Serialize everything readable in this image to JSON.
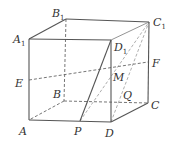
{
  "figure": {
    "vertices": {
      "A": {
        "label": "A",
        "sub": "",
        "x": 29,
        "y": 120,
        "lx": 19,
        "ly": 135
      },
      "B": {
        "label": "B",
        "sub": "",
        "x": 64,
        "y": 101,
        "lx": 53,
        "ly": 98
      },
      "C": {
        "label": "C",
        "sub": "",
        "x": 148,
        "y": 103,
        "lx": 151,
        "ly": 109
      },
      "D": {
        "label": "D",
        "sub": "",
        "x": 111,
        "y": 122,
        "lx": 105,
        "ly": 137
      },
      "A1": {
        "label": "A",
        "sub": "1",
        "x": 29,
        "y": 39,
        "lx": 13,
        "ly": 43
      },
      "B1": {
        "label": "B",
        "sub": "1",
        "x": 66,
        "y": 19,
        "lx": 52,
        "ly": 17
      },
      "C1": {
        "label": "C",
        "sub": "1",
        "x": 149,
        "y": 22,
        "lx": 153,
        "ly": 26
      },
      "D1": {
        "label": "D",
        "sub": "1",
        "x": 111,
        "y": 40,
        "lx": 114,
        "ly": 51
      },
      "E": {
        "label": "E",
        "sub": "",
        "x": 29,
        "y": 80,
        "lx": 15,
        "ly": 87
      },
      "F": {
        "label": "F",
        "sub": "",
        "x": 148,
        "y": 62,
        "lx": 152,
        "ly": 67
      },
      "P": {
        "label": "P",
        "sub": "",
        "x": 80,
        "y": 121,
        "lx": 74,
        "ly": 135
      },
      "M": {
        "label": "M",
        "sub": "",
        "x": 111,
        "y": 71,
        "lx": 113,
        "ly": 81
      },
      "Q": {
        "label": "Q",
        "sub": "",
        "x": 121,
        "y": 92,
        "lx": 123,
        "ly": 99
      }
    },
    "solid_edges": [
      [
        "A1",
        "B1"
      ],
      [
        "B1",
        "C1"
      ],
      [
        "A1",
        "D1"
      ],
      [
        "D1",
        "C1"
      ],
      [
        "A1",
        "A"
      ],
      [
        "D1",
        "D"
      ],
      [
        "C1",
        "C"
      ],
      [
        "A",
        "D"
      ],
      [
        "D",
        "C"
      ],
      [
        "P",
        "D1"
      ]
    ],
    "dashed_edges": [
      [
        "B1",
        "B"
      ],
      [
        "B",
        "A"
      ],
      [
        "B",
        "C"
      ],
      [
        "E",
        "F"
      ],
      [
        "P",
        "C1"
      ],
      [
        "D",
        "C1"
      ]
    ]
  }
}
